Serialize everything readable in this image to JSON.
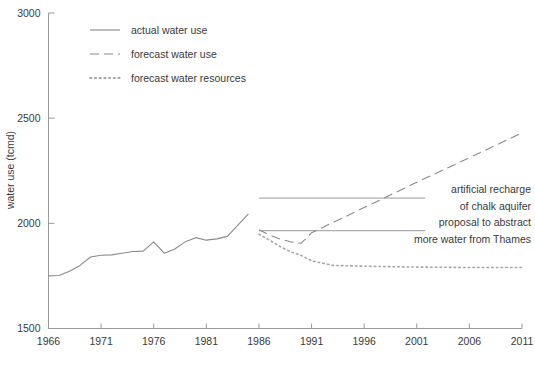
{
  "chart_data": {
    "type": "line",
    "title": "",
    "xlabel": "",
    "ylabel": "water use (tcmd)",
    "xlim": [
      1966,
      2011
    ],
    "ylim": [
      1500,
      3000
    ],
    "grid": false,
    "legend_position": "top-left",
    "xticks": [
      "1966",
      "1971",
      "1976",
      "1981",
      "1986",
      "1991",
      "1996",
      "2001",
      "2006",
      "2011"
    ],
    "xtick_values": [
      1966,
      1971,
      1976,
      1981,
      1986,
      1991,
      1996,
      2001,
      2006,
      2011
    ],
    "yticks": [
      "1500",
      "2000",
      "2500",
      "3000"
    ],
    "ytick_values": [
      1500,
      2000,
      2500,
      3000
    ],
    "series": [
      {
        "name": "actual water use",
        "style": "solid",
        "color": "#8a8a8a",
        "x": [
          1966,
          1967,
          1968,
          1969,
          1970,
          1971,
          1972,
          1973,
          1974,
          1975,
          1976,
          1977,
          1978,
          1979,
          1980,
          1981,
          1982,
          1983,
          1984,
          1985
        ],
        "values": [
          1750,
          1752,
          1772,
          1800,
          1840,
          1848,
          1850,
          1858,
          1866,
          1868,
          1912,
          1858,
          1878,
          1912,
          1932,
          1920,
          1926,
          1938,
          1992,
          2045
        ]
      },
      {
        "name": "forecast water use",
        "style": "dashed",
        "color": "#8a8a8a",
        "x": [
          1986,
          1987,
          1988,
          1989,
          1990,
          1991,
          1996,
          2001,
          2006,
          2011
        ],
        "values": [
          1970,
          1945,
          1925,
          1912,
          1905,
          1955,
          2075,
          2195,
          2312,
          2430
        ]
      },
      {
        "name": "forecast water resources",
        "style": "dotted",
        "color": "#a8a8a8",
        "x": [
          1986,
          1987,
          1988,
          1989,
          1990,
          1991,
          1993,
          1996,
          2001,
          2006,
          2011
        ],
        "values": [
          1948,
          1920,
          1890,
          1865,
          1848,
          1822,
          1800,
          1796,
          1792,
          1790,
          1790
        ]
      }
    ],
    "annotations": [
      {
        "name": "artificial-recharge",
        "line1": "artificial recharge",
        "line2": "of chalk aquifer",
        "level": 2120,
        "x_start": 1986,
        "x_end": 2001.8
      },
      {
        "name": "thames-abstraction",
        "line1": "proposal to abstract",
        "line2": "more water from Thames",
        "level": 1965,
        "x_start": 1986,
        "x_end": 2001.8
      }
    ]
  },
  "legend": {
    "items": [
      {
        "label": "actual water use",
        "style": "solid"
      },
      {
        "label": "forecast water use",
        "style": "dashed"
      },
      {
        "label": "forecast water resources",
        "style": "dotted"
      }
    ]
  },
  "colors": {
    "line": "#8a8a8a",
    "axis": "#9a9a9a",
    "text": "#3a3a3a",
    "background": "#ffffff"
  }
}
